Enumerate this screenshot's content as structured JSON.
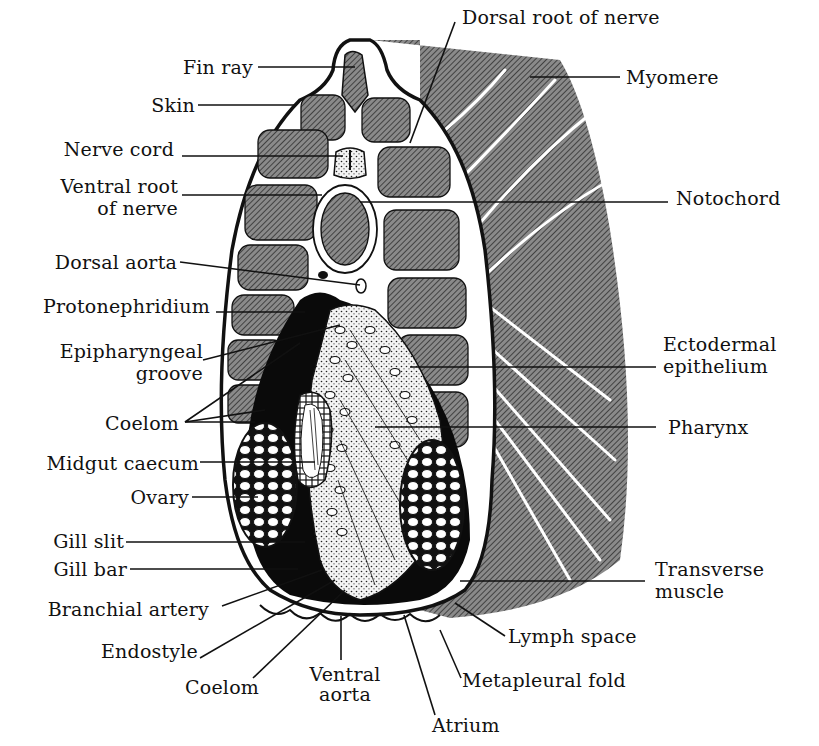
{
  "figure": {
    "colors": {
      "background": "#ffffff",
      "ink": "#111111",
      "hatch_gray": "#6e6e6e",
      "tissue_white": "#ffffff",
      "cavity_black": "#0a0a0a"
    }
  },
  "labels": {
    "left": [
      {
        "id": "fin-ray",
        "text": "Fin ray"
      },
      {
        "id": "skin",
        "text": "Skin"
      },
      {
        "id": "nerve-cord",
        "text": "Nerve cord"
      },
      {
        "id": "ventral-root",
        "line1": "Ventral root",
        "line2": "of nerve"
      },
      {
        "id": "dorsal-aorta",
        "text": "Dorsal aorta"
      },
      {
        "id": "protonephridium",
        "text": "Protonephridium"
      },
      {
        "id": "epipharyngeal-groove",
        "line1": "Epipharyngeal",
        "line2": "groove"
      },
      {
        "id": "coelom-upper",
        "text": "Coelom"
      },
      {
        "id": "midgut-caecum",
        "text": "Midgut caecum"
      },
      {
        "id": "ovary",
        "text": "Ovary"
      },
      {
        "id": "gill-slit",
        "text": "Gill slit"
      },
      {
        "id": "gill-bar",
        "text": "Gill bar"
      },
      {
        "id": "branchial-artery",
        "text": "Branchial artery"
      },
      {
        "id": "endostyle",
        "text": "Endostyle"
      },
      {
        "id": "coelom-lower",
        "text": "Coelom"
      }
    ],
    "right": [
      {
        "id": "dorsal-root",
        "text": "Dorsal root of nerve"
      },
      {
        "id": "myomere",
        "text": "Myomere"
      },
      {
        "id": "notochord",
        "text": "Notochord"
      },
      {
        "id": "ectodermal-epithelium",
        "line1": "Ectodermal",
        "line2": "epithelium"
      },
      {
        "id": "pharynx",
        "text": "Pharynx"
      },
      {
        "id": "transverse-muscle",
        "line1": "Transverse",
        "line2": "muscle"
      },
      {
        "id": "lymph-space",
        "text": "Lymph space"
      },
      {
        "id": "metapleural-fold",
        "text": "Metapleural fold"
      }
    ],
    "bottom": [
      {
        "id": "ventral-aorta",
        "line1": "Ventral",
        "line2": "aorta"
      },
      {
        "id": "atrium",
        "text": "Atrium"
      }
    ]
  }
}
